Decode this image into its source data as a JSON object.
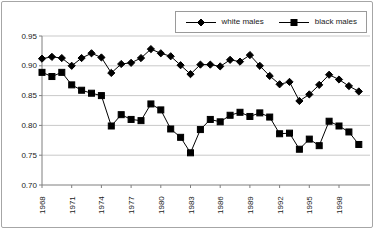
{
  "panel": {
    "background": "#ffffff",
    "border_color": "#a6a6a6"
  },
  "chart_data": {
    "type": "line",
    "title": "",
    "xlabel": "",
    "ylabel": "",
    "x": [
      1968,
      1969,
      1970,
      1971,
      1972,
      1973,
      1974,
      1975,
      1976,
      1977,
      1978,
      1979,
      1980,
      1981,
      1982,
      1983,
      1984,
      1985,
      1986,
      1987,
      1988,
      1989,
      1990,
      1991,
      1992,
      1993,
      1994,
      1995,
      1996,
      1997,
      1998,
      1999,
      2000
    ],
    "series": [
      {
        "name": "white males",
        "marker": "diamond",
        "color": "#000000",
        "values": [
          0.912,
          0.915,
          0.913,
          0.9,
          0.913,
          0.921,
          0.914,
          0.888,
          0.903,
          0.905,
          0.913,
          0.928,
          0.921,
          0.916,
          0.901,
          0.886,
          0.902,
          0.902,
          0.899,
          0.91,
          0.907,
          0.918,
          0.9,
          0.883,
          0.869,
          0.873,
          0.841,
          0.852,
          0.868,
          0.885,
          0.877,
          0.866,
          0.857
        ]
      },
      {
        "name": "black males",
        "marker": "square",
        "color": "#000000",
        "values": [
          0.889,
          0.882,
          0.889,
          0.868,
          0.859,
          0.854,
          0.85,
          0.799,
          0.818,
          0.81,
          0.808,
          0.836,
          0.826,
          0.794,
          0.78,
          0.754,
          0.793,
          0.81,
          0.806,
          0.817,
          0.822,
          0.815,
          0.821,
          0.814,
          0.786,
          0.787,
          0.76,
          0.777,
          0.766,
          0.807,
          0.799,
          0.789,
          0.768
        ]
      }
    ],
    "ylim": [
      0.7,
      0.95
    ],
    "ytick_values": [
      0.95,
      0.9,
      0.85,
      0.8,
      0.75,
      0.7
    ],
    "xtick_years": [
      1968,
      1971,
      1974,
      1977,
      1980,
      1983,
      1986,
      1989,
      1992,
      1995,
      1998
    ],
    "grid": "horizontal",
    "legend_position": "top-right",
    "colors": {
      "line": "#000000",
      "gridline": "#c9c9c9",
      "axis": "#7f7f7f",
      "tick_text": "#1a1a1a"
    }
  }
}
